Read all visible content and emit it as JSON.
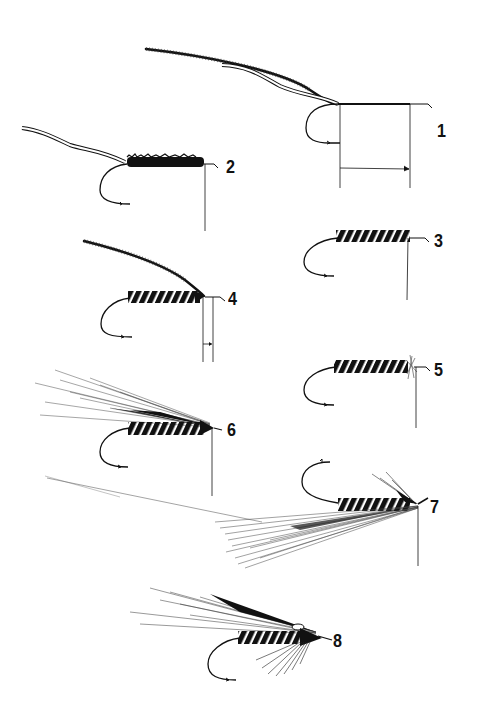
{
  "diagram": {
    "colors": {
      "ink": "#111111",
      "background": "#ffffff",
      "hackle": "#555555"
    },
    "steps": [
      {
        "number": "1",
        "label": "1",
        "x": 437,
        "y": 121,
        "description": "Chenille and ribbing tinsel tied in at hook bend; thread wound along shank; measurement marks"
      },
      {
        "number": "2",
        "label": "2",
        "x": 228,
        "y": 160,
        "description": "Chenille body wrapped forward to head position"
      },
      {
        "number": "3",
        "label": "3",
        "x": 434,
        "y": 232,
        "description": "Tinsel ribbed over body"
      },
      {
        "number": "4",
        "label": "4",
        "x": 228,
        "y": 290,
        "description": "Hackle tied in at head; short measurement marks"
      },
      {
        "number": "5",
        "label": "5",
        "x": 434,
        "y": 360,
        "description": "Hackle wound collar"
      },
      {
        "number": "6",
        "label": "6",
        "x": 228,
        "y": 420,
        "description": "Wing fibers tied in on top"
      },
      {
        "number": "7",
        "label": "7",
        "x": 431,
        "y": 498,
        "description": "Fly inverted; throat/beard fibers tied in"
      },
      {
        "number": "8",
        "label": "8",
        "x": 332,
        "y": 630,
        "description": "Completed fly with wing, throat and jungle-cock cheek"
      }
    ]
  }
}
